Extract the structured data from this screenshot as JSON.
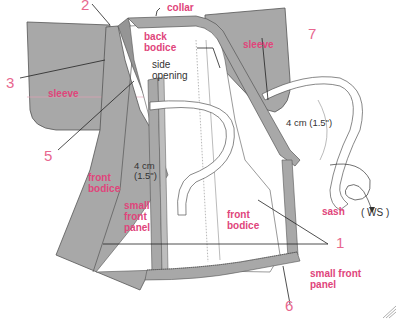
{
  "diagram": {
    "colors": {
      "fabric": "#a8a8a8",
      "fabric_dark": "#8f8f8f",
      "outline": "#555555",
      "lining": "#ffffff",
      "label_accent": "#e0457b",
      "number_accent": "#e8678f",
      "leader_line": "#222222"
    },
    "part_labels": {
      "collar": "collar",
      "back_bodice": "back\nbodice",
      "side_opening": "side\nopening",
      "sleeve_left": "sleeve",
      "sleeve_right": "sleeve",
      "front_bodice_left": "front\nbodice",
      "small_front_panel_left": "small\nfront\npanel",
      "front_bodice_inner": "front\nbodice",
      "small_front_panel_inner": "small front\npanel",
      "sash": "sash",
      "ws": "( WS )"
    },
    "measurements": {
      "left": "4 cm\n(1.5\")",
      "right": "4 cm (1.5\")"
    },
    "step_numbers": {
      "n1": "1",
      "n2": "2",
      "n3": "3",
      "n5": "5",
      "n6": "6",
      "n7": "7"
    }
  }
}
